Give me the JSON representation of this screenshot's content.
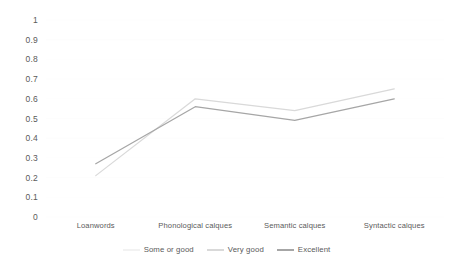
{
  "chart_data": {
    "type": "line",
    "title": "",
    "subtitle": "",
    "xlabel": "",
    "ylabel": "",
    "categories": [
      "Loanwords",
      "Phonological calques",
      "Semantic calques",
      "Syntactic calques"
    ],
    "series": [
      {
        "name": "Some or good",
        "color": "#f2f2f2",
        "values": [
          null,
          null,
          null,
          null
        ]
      },
      {
        "name": "Very good",
        "color": "#d9d9d9",
        "values": [
          0.21,
          0.6,
          0.54,
          0.65
        ]
      },
      {
        "name": "Excellent",
        "color": "#a6a6a6",
        "values": [
          0.27,
          0.56,
          0.49,
          0.6
        ]
      }
    ],
    "ylim": [
      0,
      1
    ],
    "y_ticks": [
      "1",
      "0.9",
      "0.8",
      "0.7",
      "0.6",
      "0.5",
      "0.4",
      "0.3",
      "0.2",
      "0.1",
      "0"
    ],
    "y_tick_values": [
      1,
      0.9,
      0.8,
      0.7,
      0.6,
      0.5,
      0.4,
      0.3,
      0.2,
      0.1,
      0
    ],
    "grid": true,
    "grid_color": "#fbfbfb",
    "legend_position": "bottom",
    "background": "#ffffff",
    "text_color": "#595959"
  },
  "axis": {
    "y_label_0": "1",
    "y_label_1": "0.9",
    "y_label_2": "0.8",
    "y_label_3": "0.7",
    "y_label_4": "0.6",
    "y_label_5": "0.5",
    "y_label_6": "0.4",
    "y_label_7": "0.3",
    "y_label_8": "0.2",
    "y_label_9": "0.1",
    "y_label_10": "0",
    "x_label_0": "Loanwords",
    "x_label_1": "Phonological calques",
    "x_label_2": "Semantic calques",
    "x_label_3": "Syntactic calques"
  },
  "legend": {
    "item_0": "Some or good",
    "item_1": "Very good",
    "item_2": "Excellent"
  }
}
